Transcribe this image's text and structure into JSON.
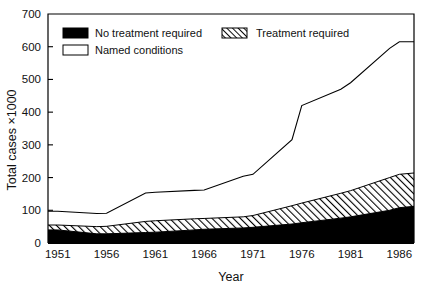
{
  "chart_data": {
    "type": "area",
    "title": "",
    "xlabel": "Year",
    "ylabel": "Total cases ×1000",
    "xlim": [
      1950,
      1987.5
    ],
    "ylim": [
      0,
      700
    ],
    "grid": false,
    "stacked": true,
    "legend_position": "top-inside",
    "x": [
      1950,
      1951,
      1955,
      1956,
      1960,
      1961,
      1965,
      1966,
      1970,
      1971,
      1975,
      1976,
      1980,
      1981,
      1985,
      1986,
      1987.5
    ],
    "xticks": [
      1951,
      1956,
      1961,
      1966,
      1971,
      1976,
      1981,
      1986
    ],
    "xticklabels": [
      "1951",
      "1956",
      "1961",
      "1966",
      "1971",
      "1976",
      "1981",
      "1986"
    ],
    "yticks": [
      0,
      100,
      200,
      300,
      400,
      500,
      600,
      700
    ],
    "yticklabels": [
      "0",
      "100",
      "200",
      "300",
      "400",
      "500",
      "600",
      "700"
    ],
    "series": [
      {
        "name": "No treatment required",
        "fill": "solid-black",
        "color": "#000000",
        "values": [
          40,
          40,
          28,
          28,
          32,
          33,
          40,
          42,
          46,
          48,
          58,
          62,
          76,
          80,
          100,
          108,
          112
        ]
      },
      {
        "name": "Treatment required",
        "fill": "diagonal-hatch",
        "color": "#000000",
        "values": [
          15,
          15,
          22,
          23,
          34,
          35,
          34,
          33,
          34,
          36,
          56,
          60,
          76,
          80,
          100,
          102,
          102
        ]
      },
      {
        "name": "Named conditions",
        "fill": "white",
        "color": "#000000",
        "values": [
          42,
          42,
          40,
          40,
          87,
          87,
          87,
          87,
          124,
          126,
          202,
          298,
          318,
          330,
          395,
          405,
          401
        ]
      }
    ],
    "cumulative_top_line": [
      97,
      97,
      90,
      91,
      153,
      155,
      161,
      162,
      204,
      210,
      316,
      420,
      470,
      490,
      595,
      615,
      615
    ],
    "annotations": []
  },
  "legend": {
    "entries": [
      {
        "label": "No treatment required",
        "swatch": "solid-black"
      },
      {
        "label": "Treatment required",
        "swatch": "diagonal-hatch"
      },
      {
        "label": "Named conditions",
        "swatch": "white"
      }
    ]
  }
}
